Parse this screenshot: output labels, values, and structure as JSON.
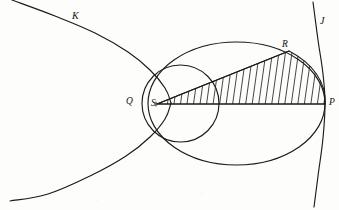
{
  "figure": {
    "width": 339,
    "height": 210,
    "background_color": "#fdfdfb",
    "ink_color": "#1b1b1b",
    "labels": {
      "curve_left": "K",
      "curve_right": "J",
      "point_q": "Q",
      "point_s": "S",
      "point_r": "R",
      "point_p": "P"
    },
    "label_positions": {
      "curve_left": {
        "x": 72,
        "y": 11
      },
      "curve_right": {
        "x": 320,
        "y": 16
      },
      "point_q": {
        "x": 126,
        "y": 97
      },
      "point_s": {
        "x": 151,
        "y": 99
      },
      "point_r": {
        "x": 282,
        "y": 40
      },
      "point_p": {
        "x": 329,
        "y": 98
      }
    },
    "geometry": {
      "ellipse": {
        "cx": 236.5,
        "cy": 103.5,
        "rx": 88.5,
        "ry": 61.5
      },
      "circle": {
        "cx": 180.5,
        "cy": 103.5,
        "r": 38.5
      },
      "focus_s": {
        "x": 157,
        "y": 104
      },
      "point_r": {
        "x": 289,
        "y": 51
      },
      "point_p": {
        "x": 325,
        "y": 104
      },
      "hatch_line_count": 26,
      "hatch_tilt_degrees": 8
    },
    "curves": {
      "hyperbola_left_branch_upper": "M 12 0 L 55 16 L 95 33 L 128 52 L 150 70 L 165 88 L 171 103",
      "hyperbola_left_branch_lower": "M 171 103 L 165 119 L 150 137 L 126 156 L 92 175 L 48 194 L 10 201",
      "parabola_right_arc": "M 313 2 L 318 40 L 323 74 L 325 104 L 323 138 L 318 176 L 314 207"
    }
  }
}
